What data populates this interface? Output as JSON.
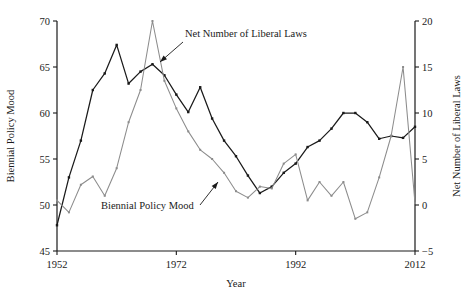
{
  "chart_data": {
    "type": "line",
    "title": "",
    "xlabel": "Year",
    "ylabel": "Biennial Policy Mood",
    "y2label": "Net Number of Liberal Laws",
    "xlim": [
      1952,
      2012
    ],
    "ylim": [
      45,
      70
    ],
    "y2lim": [
      -5,
      20
    ],
    "grid": false,
    "legend_position": "inline-annotations",
    "xticks": [
      1952,
      1972,
      1992,
      2012
    ],
    "xtick_labels": [
      "1952",
      "1972",
      "1992",
      "2012"
    ],
    "yticks": [
      45,
      50,
      55,
      60,
      65,
      70
    ],
    "ytick_labels": [
      "45",
      "50",
      "55",
      "60",
      "65",
      "70"
    ],
    "y2ticks": [
      -5,
      0,
      5,
      10,
      15,
      20
    ],
    "y2tick_labels": [
      "−5",
      "0",
      "5",
      "10",
      "15",
      "20"
    ],
    "annotations": [
      {
        "text": "Net Number of Liberal Laws",
        "text_x": 185,
        "text_y": 37,
        "arrow_from_x": 183,
        "arrow_from_y": 42,
        "arrow_to_x": 160,
        "arrow_to_y": 62
      },
      {
        "text": "Biennial Policy Mood",
        "text_x": 101,
        "text_y": 209,
        "arrow_from_x": 200,
        "arrow_from_y": 205,
        "arrow_to_x": 218,
        "arrow_to_y": 182
      }
    ],
    "series": [
      {
        "name": "Biennial Policy Mood",
        "axis": "left",
        "color": "#1a1a1a",
        "marker": "square",
        "x": [
          1952,
          1954,
          1956,
          1958,
          1960,
          1962,
          1964,
          1966,
          1968,
          1970,
          1972,
          1974,
          1976,
          1978,
          1980,
          1982,
          1984,
          1986,
          1988,
          1990,
          1992,
          1994,
          1996,
          1998,
          2000,
          2002,
          2004,
          2006,
          2008,
          2010,
          2012
        ],
        "y": [
          47.8,
          53.0,
          57.0,
          62.5,
          64.3,
          67.4,
          63.2,
          64.5,
          65.3,
          64.1,
          62.0,
          60.1,
          62.8,
          59.4,
          57.0,
          55.3,
          53.2,
          51.3,
          52.0,
          53.5,
          54.5,
          56.3,
          57.0,
          58.3,
          60.0,
          60.0,
          59.0,
          57.2,
          57.5,
          57.3,
          58.5
        ]
      },
      {
        "name": "Net Number of Liberal Laws",
        "axis": "right",
        "color": "#8c8c8c",
        "marker": "square",
        "x": [
          1952,
          1954,
          1956,
          1958,
          1960,
          1962,
          1964,
          1966,
          1968,
          1970,
          1972,
          1974,
          1976,
          1978,
          1980,
          1982,
          1984,
          1986,
          1988,
          1990,
          1992,
          1994,
          1996,
          1998,
          2000,
          2002,
          2004,
          2006,
          2008,
          2010,
          2012
        ],
        "y": [
          0.5,
          -0.8,
          2.2,
          3.1,
          1.0,
          4.0,
          9.0,
          12.5,
          20.0,
          13.5,
          10.5,
          8.0,
          6.0,
          5.0,
          3.5,
          1.5,
          0.8,
          2.0,
          1.8,
          4.5,
          5.5,
          0.5,
          2.5,
          1.0,
          2.5,
          -1.5,
          -0.8,
          3.0,
          7.5,
          15.0,
          0.2
        ]
      }
    ]
  },
  "axes": {
    "left_title": "Biennial Policy Mood",
    "right_title": "Net Number of Liberal Laws",
    "bottom_title": "Year"
  }
}
